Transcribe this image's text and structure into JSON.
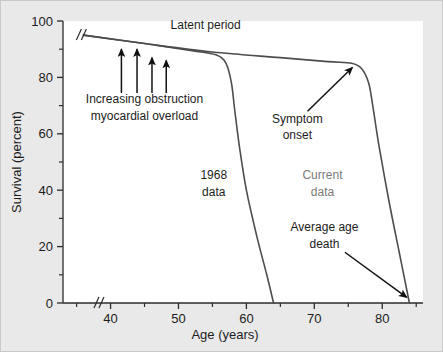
{
  "chart_data": {
    "type": "line",
    "title": "",
    "xlabel": "Age (years)",
    "ylabel": "Survival (percent)",
    "xlim": [
      33,
      86
    ],
    "ylim": [
      0,
      100
    ],
    "x_ticks_major": [
      40,
      50,
      60,
      70,
      80
    ],
    "x_ticks_major_labels": [
      "40",
      "50",
      "60",
      "70",
      "80"
    ],
    "x_ticks_minor": [
      35,
      45,
      55,
      65,
      75,
      85
    ],
    "y_ticks_major": [
      0,
      20,
      40,
      60,
      80,
      100
    ],
    "y_ticks_major_labels": [
      "0",
      "20",
      "40",
      "60",
      "80",
      "100"
    ],
    "y_ticks_minor": [
      10,
      30,
      50,
      70,
      90
    ],
    "grid": false,
    "legend": "none",
    "axis_break": {
      "axis": "x",
      "at": 38,
      "symbol": "//"
    },
    "series": [
      {
        "name": "1968 data",
        "color": "#4d4d4d",
        "points": [
          [
            36.0,
            95.0
          ],
          [
            45.0,
            92.0
          ],
          [
            52.0,
            89.5
          ],
          [
            55.5,
            88.0
          ],
          [
            57.0,
            85.0
          ],
          [
            57.8,
            78.0
          ],
          [
            58.3,
            68.0
          ],
          [
            59.0,
            55.0
          ],
          [
            60.0,
            40.0
          ],
          [
            61.5,
            24.0
          ],
          [
            63.0,
            10.0
          ],
          [
            64.0,
            0.0
          ]
        ]
      },
      {
        "name": "Current data",
        "color": "#4d4d4d",
        "points": [
          [
            36.0,
            95.0
          ],
          [
            45.0,
            92.0
          ],
          [
            55.0,
            89.0
          ],
          [
            65.0,
            87.0
          ],
          [
            72.0,
            85.6
          ],
          [
            75.5,
            85.0
          ],
          [
            77.0,
            83.0
          ],
          [
            78.0,
            78.0
          ],
          [
            78.6,
            70.0
          ],
          [
            79.5,
            56.0
          ],
          [
            81.0,
            36.0
          ],
          [
            82.5,
            18.0
          ],
          [
            84.0,
            0.0
          ]
        ]
      }
    ],
    "annotations": [
      {
        "id": "latent-period",
        "text": "Latent period",
        "x": 54.0,
        "y": 97.0,
        "style": "plain"
      },
      {
        "id": "increasing-obstruction",
        "text": "Increasing obstruction",
        "x": 45.0,
        "y": 71.0,
        "style": "plain"
      },
      {
        "id": "myocardial-overload",
        "text": "myocardial overload",
        "x": 45.0,
        "y": 65.0,
        "style": "plain"
      },
      {
        "id": "symptom-onset",
        "text": "Symptom",
        "x": 67.5,
        "y": 64.0,
        "style": "plain"
      },
      {
        "id": "symptom-onset-2",
        "text": "onset",
        "x": 67.5,
        "y": 58.0,
        "style": "plain"
      },
      {
        "id": "data-1968",
        "text": "1968",
        "x": 55.2,
        "y": 44.0,
        "style": "plain"
      },
      {
        "id": "data-1968-2",
        "text": "data",
        "x": 55.2,
        "y": 38.0,
        "style": "plain"
      },
      {
        "id": "current-data",
        "text": "Current",
        "x": 71.2,
        "y": 44.0,
        "style": "muted"
      },
      {
        "id": "current-data-2",
        "text": "data",
        "x": 71.2,
        "y": 38.0,
        "style": "muted"
      },
      {
        "id": "average-age-death",
        "text": "Average age",
        "x": 71.5,
        "y": 25.5,
        "style": "plain"
      },
      {
        "id": "average-age-death-2",
        "text": "death",
        "x": 71.5,
        "y": 19.5,
        "style": "plain"
      }
    ],
    "arrows": [
      {
        "id": "obstruction-arrow-1",
        "x": 41.6,
        "y_tail": 74.5,
        "y_head": 90.0
      },
      {
        "id": "obstruction-arrow-2",
        "x": 43.9,
        "y_tail": 74.5,
        "y_head": 90.0
      },
      {
        "id": "obstruction-arrow-3",
        "x": 46.1,
        "y_tail": 74.5,
        "y_head": 87.0
      },
      {
        "id": "obstruction-arrow-4",
        "x": 48.2,
        "y_tail": 74.5,
        "y_head": 86.0
      },
      {
        "id": "symptom-onset-pointer",
        "x_tail": 69.0,
        "y_tail": 68.0,
        "x_head": 75.6,
        "y_head": 83.5
      },
      {
        "id": "average-age-death-pointer",
        "x_tail": 74.5,
        "y_tail": 18.0,
        "x_head": 83.6,
        "y_head": 2.0
      }
    ]
  },
  "axis": {
    "y_label": "Survival (percent)",
    "x_label": "Age (years)"
  },
  "colors": {
    "background": "#e9e9e9",
    "plot_background": "#ffffff",
    "curve": "#4d4d4d",
    "text": "#1c1c1c",
    "muted_text": "#7b7b7b"
  }
}
